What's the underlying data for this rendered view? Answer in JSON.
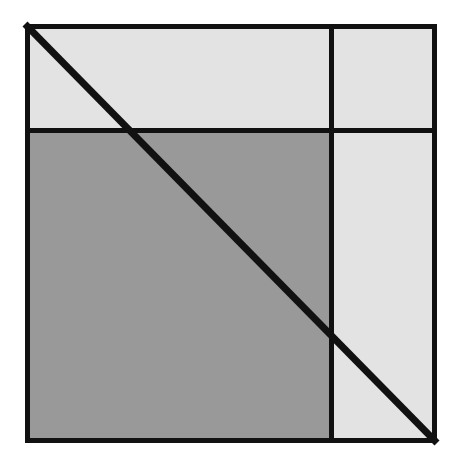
{
  "canvas": {
    "width": 458,
    "height": 457,
    "background": "#ffffff"
  },
  "figure": {
    "type": "geometric-diagram",
    "square": {
      "x": 25,
      "y": 24,
      "width": 412,
      "height": 419,
      "stroke": "#111111",
      "stroke_width": 5
    },
    "dividers": {
      "horizontal": {
        "label": "horizontal-divider",
        "y": 130,
        "x1": 25,
        "x2": 437,
        "stroke": "#111111",
        "stroke_width": 5
      },
      "vertical": {
        "label": "vertical-divider",
        "x": 331,
        "y1": 24,
        "y2": 443,
        "stroke": "#111111",
        "stroke_width": 5
      }
    },
    "diagonal": {
      "label": "main-diagonal",
      "x1": 25,
      "y1": 24,
      "x2": 437,
      "y2": 443,
      "stroke": "#111111",
      "stroke_width": 7
    },
    "regions": [
      {
        "name": "top-left-region",
        "fill": "#e3e3e3",
        "x": 25,
        "y": 24,
        "width": 306,
        "height": 106
      },
      {
        "name": "top-right-region",
        "fill": "#e3e3e3",
        "x": 331,
        "y": 24,
        "width": 106,
        "height": 106
      },
      {
        "name": "bottom-left-region",
        "fill": "#999999",
        "x": 25,
        "y": 130,
        "width": 306,
        "height": 313
      },
      {
        "name": "bottom-right-region",
        "fill": "#e3e3e3",
        "x": 331,
        "y": 130,
        "width": 106,
        "height": 313
      }
    ],
    "colors": {
      "light_gray": "#e3e3e3",
      "dark_gray": "#999999",
      "line_black": "#111111",
      "background_white": "#ffffff"
    }
  }
}
